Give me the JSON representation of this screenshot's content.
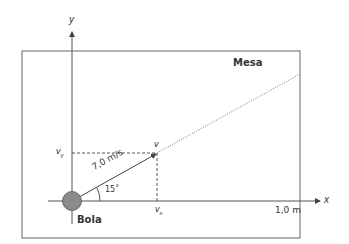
{
  "diagram": {
    "table_label": "Mesa",
    "ball_label": "Bola",
    "axis_x_label": "x",
    "axis_y_label": "y",
    "velocity_label": "v",
    "vx_label": "v",
    "vx_sub": "x",
    "vy_label": "v",
    "vy_sub": "y",
    "speed_label": "7,0 m/s",
    "angle_label": "15˚",
    "distance_label": "1,0 m",
    "colors": {
      "lines": "#555555",
      "ball": "#8a8a8a",
      "ball_stroke": "#444444",
      "text": "#333333"
    }
  }
}
